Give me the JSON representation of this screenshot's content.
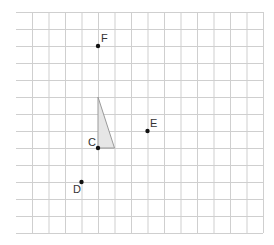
{
  "grid": {
    "left": 16,
    "right": 263,
    "top": 12,
    "bottom": 233,
    "vertical_lines_x": [
      32,
      48.5,
      65,
      81.5,
      98,
      114.5,
      131,
      147.5,
      164,
      180.5,
      197,
      213.5,
      230,
      246.5,
      263
    ],
    "horizontal_lines_y": [
      12,
      29,
      46,
      63,
      80,
      97,
      114,
      131,
      148,
      165,
      182,
      199,
      216,
      233
    ],
    "line_color": "#cfcfcf"
  },
  "triangle": {
    "points": [
      [
        98,
        97
      ],
      [
        98,
        148
      ],
      [
        114.5,
        148
      ]
    ],
    "fill": "#e6e6e6",
    "stroke": "#9a9a9a"
  },
  "points": [
    {
      "name": "F",
      "x": 98,
      "y": 46,
      "label": "F",
      "label_x": 101,
      "label_y": 33
    },
    {
      "name": "C",
      "x": 98,
      "y": 148,
      "label": "C",
      "label_x": 88,
      "label_y": 137
    },
    {
      "name": "E",
      "x": 147.5,
      "y": 131,
      "label": "E",
      "label_x": 150,
      "label_y": 118
    },
    {
      "name": "D",
      "x": 81.5,
      "y": 182,
      "label": "D",
      "label_x": 73,
      "label_y": 184
    }
  ]
}
